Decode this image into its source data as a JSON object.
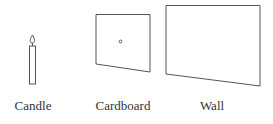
{
  "diagram": {
    "objects": [
      {
        "id": "candle",
        "label": "Candle"
      },
      {
        "id": "cardboard",
        "label": "Cardboard",
        "feature": "pinhole"
      },
      {
        "id": "wall",
        "label": "Wall"
      }
    ]
  },
  "colors": {
    "line": "#555555",
    "text": "#333333",
    "background": "#ffffff"
  }
}
